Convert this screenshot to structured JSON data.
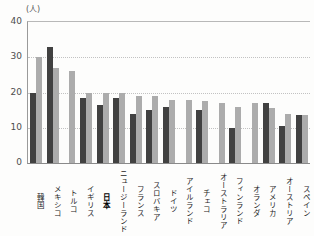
{
  "chart_data": {
    "type": "bar",
    "title": "",
    "unit_label": "(人)",
    "xlabel": "",
    "ylabel": "(人)",
    "ylim": [
      0,
      40
    ],
    "yticks": [
      0,
      10,
      20,
      30,
      40
    ],
    "grid": "dotted-horizontal",
    "legend": "none",
    "categories": [
      "韓国",
      "メキシコ",
      "トルコ",
      "イギリス",
      "日本",
      "ニュージーランド",
      "フランス",
      "スロバキア",
      "ドイツ",
      "アイルランド",
      "チェコ",
      "オーストラリア",
      "フィンランド",
      "オランダ",
      "アメリカ",
      "オーストリア",
      "スペイン"
    ],
    "bold_category": "日本",
    "series": [
      {
        "name": "dark-series",
        "color": "#414141",
        "values": [
          20,
          33,
          null,
          18.5,
          16.5,
          18.5,
          14,
          15,
          16,
          null,
          15,
          null,
          10,
          null,
          17,
          10.5,
          13.5
        ]
      },
      {
        "name": "light-series",
        "color": "#acacac",
        "values": [
          30,
          27,
          26,
          20,
          20,
          20,
          19,
          19,
          18,
          18,
          17.5,
          17,
          16,
          17,
          15.5,
          14,
          13.5
        ]
      }
    ],
    "colors": {
      "axis_line": "#9a9a9a",
      "grid_line": "#c2c2c2",
      "tick_text": "#4d4d4d",
      "label_text": "#1c1c1c",
      "background": "#fdfdfc"
    }
  }
}
